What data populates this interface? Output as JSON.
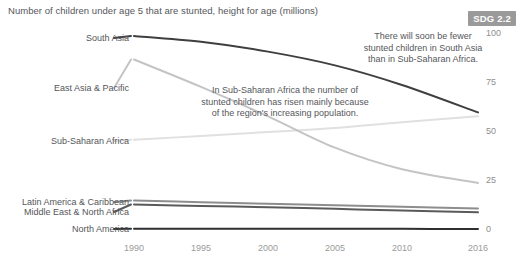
{
  "header": {
    "title": "Number of children under age 5 that are stunted, height for age (millions)",
    "badge": "SDG 2.2"
  },
  "annotations": {
    "sub_saharan": "In Sub-Saharan Africa the number of\nstunted children has risen mainly because\nof the region's increasing population.",
    "south_asia": "There will soon be fewer\nstunted children in South Asia\nthan in Sub-Saharan Africa."
  },
  "colors": {
    "south_asia": "#3f3f3f",
    "east_asia_pacific": "#c4c4c4",
    "sub_saharan_africa": "#e0e0e0",
    "latin_america": "#8d8d8d",
    "middle_east": "#5a5a5a",
    "north_america": "#2f2f2f",
    "badge_bg": "#9a9a9a",
    "axis_text": "#9a9a9a",
    "title_text": "#55565a"
  },
  "chart_data": {
    "type": "line",
    "title": "Number of children under age 5 that are stunted, height for age (millions)",
    "xlabel": "",
    "ylabel": "",
    "xlim": [
      1990,
      2016
    ],
    "ylim": [
      0,
      100
    ],
    "grid": false,
    "legend_position": "left-inline",
    "x": [
      1990,
      1995,
      2000,
      2005,
      2010,
      2016
    ],
    "xtick_labels": [
      "1990",
      "1995",
      "2000",
      "2005",
      "2010",
      "2016"
    ],
    "ytick_labels": [
      "0",
      "25",
      "50",
      "75",
      "100"
    ],
    "yticks": [
      0,
      25,
      50,
      75,
      100
    ],
    "series": [
      {
        "name": "South Asia",
        "color": "#3f3f3f",
        "values": [
          99,
          96,
          91,
          84,
          74,
          60
        ]
      },
      {
        "name": "East Asia & Pacific",
        "color": "#c4c4c4",
        "values": [
          87,
          73,
          58,
          42,
          31,
          24
        ]
      },
      {
        "name": "Sub-Saharan Africa",
        "color": "#e0e0e0",
        "values": [
          46,
          48,
          50,
          52,
          55,
          58
        ]
      },
      {
        "name": "Latin America & Caribbean",
        "color": "#8d8d8d",
        "values": [
          15,
          14.2,
          13.4,
          12.6,
          11.8,
          11
        ]
      },
      {
        "name": "Middle East & North Africa",
        "color": "#5a5a5a",
        "values": [
          13,
          12.3,
          11.6,
          10.8,
          9.9,
          9
        ]
      },
      {
        "name": "North America",
        "color": "#2f2f2f",
        "values": [
          0.6,
          0.6,
          0.6,
          0.6,
          0.6,
          0.5
        ]
      }
    ]
  },
  "series_labels": [
    {
      "label": "South Asia",
      "y": 38
    },
    {
      "label": "East Asia & Pacific",
      "y": 88
    },
    {
      "label": "Sub-Saharan Africa",
      "y": 141
    },
    {
      "label": "Latin America & Caribbean",
      "y": 202
    },
    {
      "label": "Middle East & North Africa",
      "y": 212
    },
    {
      "label": "North America",
      "y": 229
    }
  ],
  "y_axis": [
    {
      "label": "100",
      "y": 34
    },
    {
      "label": "75",
      "y": 83
    },
    {
      "label": "50",
      "y": 132
    },
    {
      "label": "25",
      "y": 181
    },
    {
      "label": "0",
      "y": 230
    }
  ],
  "x_axis": [
    {
      "label": "1990",
      "x": 134
    },
    {
      "label": "1995",
      "x": 201
    },
    {
      "label": "2000",
      "x": 268
    },
    {
      "label": "2005",
      "x": 335
    },
    {
      "label": "2010",
      "x": 402
    },
    {
      "label": "2016",
      "x": 478
    }
  ]
}
